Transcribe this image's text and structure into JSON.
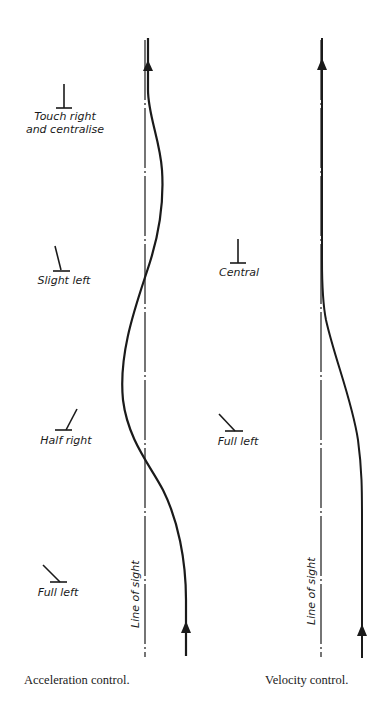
{
  "acceleration": {
    "caption": "Acceleration control.",
    "line_of_sight_label": "Line of sight",
    "stick_positions": [
      {
        "label_line1": "Touch right",
        "label_line2": "and centralise",
        "stick": "central"
      },
      {
        "label_line1": "Slight left",
        "stick": "slight-left"
      },
      {
        "label_line1": "Half right",
        "stick": "half-right"
      },
      {
        "label_line1": "Full left",
        "stick": "full-left"
      }
    ]
  },
  "velocity": {
    "caption": "Velocity control.",
    "line_of_sight_label": "Line of sight",
    "stick_positions": [
      {
        "label_line1": "Central",
        "stick": "central"
      },
      {
        "label_line1": "Full left",
        "stick": "full-left"
      }
    ]
  },
  "colors": {
    "ink": "#1a1a1a",
    "background": "#ffffff"
  }
}
